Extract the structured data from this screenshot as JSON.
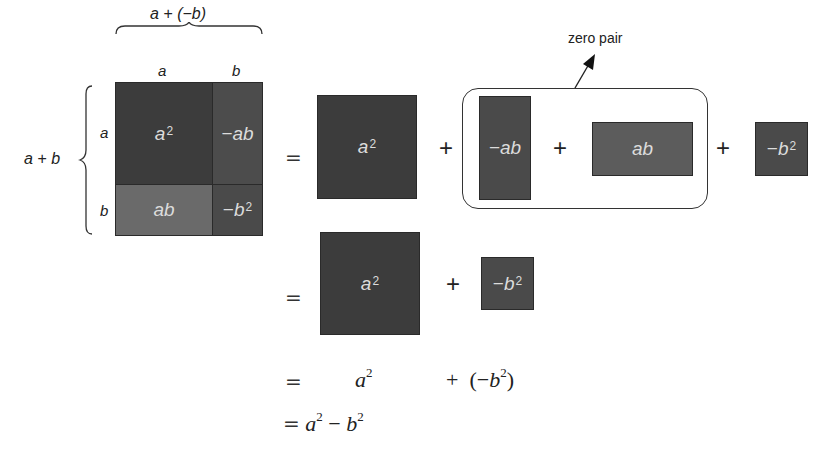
{
  "grid": {
    "top_brace_label": "a + (−b)",
    "col_labels": [
      "a",
      "b"
    ],
    "side_brace_label": "a + b",
    "row_labels": [
      "a",
      "b"
    ],
    "cells": [
      {
        "base": "a",
        "exp": "2",
        "sign": "",
        "color": "#3c3c3c"
      },
      {
        "base": "ab",
        "exp": "",
        "sign": "−",
        "color": "#4c4c4c"
      },
      {
        "base": "ab",
        "exp": "",
        "sign": "",
        "color": "#6a6a6a"
      },
      {
        "base": "b",
        "exp": "2",
        "sign": "−",
        "color": "#4a4a4a"
      }
    ]
  },
  "row1": {
    "equals": "=",
    "a2": {
      "base": "a",
      "exp": "2",
      "color": "#3c3c3c"
    },
    "plus1": "+",
    "zero_pair_label": "zero pair",
    "neg_ab": {
      "sign": "−",
      "base": "ab",
      "color": "#4a4a4a"
    },
    "plus2": "+",
    "ab": {
      "base": "ab",
      "color": "#5c5c5c"
    },
    "plus3": "+",
    "neg_b2": {
      "sign": "−",
      "base": "b",
      "exp": "2",
      "color": "#4a4a4a"
    }
  },
  "row2": {
    "equals": "=",
    "a2": {
      "base": "a",
      "exp": "2",
      "color": "#3c3c3c"
    },
    "plus": "+",
    "neg_b2": {
      "sign": "−",
      "base": "b",
      "exp": "2",
      "color": "#4a4a4a"
    }
  },
  "row3": {
    "equals": "=",
    "a": "a",
    "a_exp": "2",
    "plus": "+",
    "open": "(−",
    "b": "b",
    "b_exp": "2",
    "close": ")"
  },
  "row4": {
    "equals": "=",
    "a": "a",
    "a_exp": "2",
    "minus": "−",
    "b": "b",
    "b_exp": "2"
  }
}
